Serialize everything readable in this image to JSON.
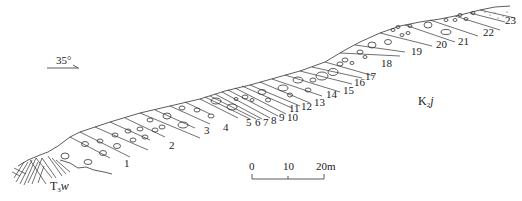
{
  "diagram": {
    "type": "geological-cross-section",
    "orientation": {
      "label": "35°",
      "arrow": "right"
    },
    "formations": {
      "base": {
        "label_main": "T",
        "label_sub": "3",
        "label_suffix": "w"
      },
      "main": {
        "label_main": "K",
        "label_sub": "2",
        "label_suffix": "j"
      }
    },
    "beds": [
      {
        "n": "1",
        "x": 124,
        "y": 167
      },
      {
        "n": "2",
        "x": 169,
        "y": 149
      },
      {
        "n": "3",
        "x": 204,
        "y": 134
      },
      {
        "n": "4",
        "x": 223,
        "y": 131
      },
      {
        "n": "5",
        "x": 246,
        "y": 126
      },
      {
        "n": "6",
        "x": 255,
        "y": 126
      },
      {
        "n": "7",
        "x": 263,
        "y": 126
      },
      {
        "n": "8",
        "x": 271,
        "y": 124
      },
      {
        "n": "9",
        "x": 279,
        "y": 121
      },
      {
        "n": "10",
        "x": 287,
        "y": 121
      },
      {
        "n": "11",
        "x": 289,
        "y": 112
      },
      {
        "n": "12",
        "x": 301,
        "y": 110
      },
      {
        "n": "13",
        "x": 314,
        "y": 106
      },
      {
        "n": "14",
        "x": 326,
        "y": 98
      },
      {
        "n": "15",
        "x": 343,
        "y": 94
      },
      {
        "n": "16",
        "x": 354,
        "y": 86
      },
      {
        "n": "17",
        "x": 365,
        "y": 80
      },
      {
        "n": "18",
        "x": 381,
        "y": 67
      },
      {
        "n": "19",
        "x": 411,
        "y": 55
      },
      {
        "n": "20",
        "x": 436,
        "y": 48
      },
      {
        "n": "21",
        "x": 458,
        "y": 45
      },
      {
        "n": "22",
        "x": 483,
        "y": 36
      },
      {
        "n": "23",
        "x": 505,
        "y": 24
      }
    ],
    "scale_bar": {
      "ticks": [
        "0",
        "10",
        "20m"
      ],
      "unit": "m"
    }
  }
}
